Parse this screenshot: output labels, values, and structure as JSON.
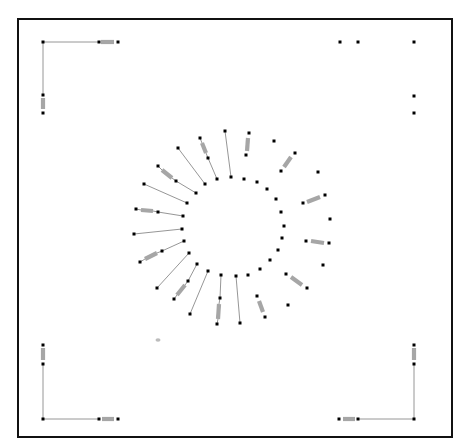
{
  "diagram": {
    "type": "circuit-layout",
    "frame": {
      "x": 18,
      "y": 19,
      "width": 434,
      "height": 418,
      "stroke": "#111111"
    },
    "colors": {
      "wire": "#8a8a8a",
      "node": "#000000",
      "resistor": "#a6a6a6",
      "background": "#ffffff"
    },
    "corners": [
      {
        "id": "top-left",
        "nodes": [
          [
            43,
            42
          ],
          [
            99,
            42
          ],
          [
            118,
            42
          ],
          [
            43,
            95
          ],
          [
            43,
            113
          ]
        ],
        "wires": [
          [
            43,
            42,
            99,
            42
          ],
          [
            43,
            42,
            43,
            95
          ]
        ],
        "resistors": [
          [
            101,
            42,
            114,
            42
          ],
          [
            43,
            98,
            43,
            109
          ]
        ]
      },
      {
        "id": "top-right",
        "nodes": [
          [
            340,
            42
          ],
          [
            358,
            42
          ],
          [
            414,
            42
          ],
          [
            414,
            96
          ],
          [
            414,
            113
          ]
        ],
        "wires": [],
        "resistors": []
      },
      {
        "id": "bottom-left",
        "nodes": [
          [
            43,
            345
          ],
          [
            43,
            364
          ],
          [
            43,
            419
          ],
          [
            99,
            419
          ],
          [
            118,
            419
          ]
        ],
        "wires": [
          [
            43,
            364,
            43,
            419
          ],
          [
            43,
            419,
            99,
            419
          ]
        ],
        "resistors": [
          [
            43,
            348,
            43,
            360
          ],
          [
            102,
            419,
            114,
            419
          ]
        ]
      },
      {
        "id": "bottom-right",
        "nodes": [
          [
            339,
            419
          ],
          [
            358,
            419
          ],
          [
            414,
            419
          ],
          [
            414,
            364
          ],
          [
            414,
            345
          ]
        ],
        "wires": [
          [
            358,
            419,
            414,
            419
          ],
          [
            414,
            419,
            414,
            364
          ]
        ],
        "resistors": [
          [
            343,
            419,
            355,
            419
          ],
          [
            414,
            348,
            414,
            360
          ]
        ]
      }
    ],
    "ring": {
      "inner_nodes": [
        [
          231,
          177
        ],
        [
          244,
          179
        ],
        [
          257,
          182
        ],
        [
          267,
          189
        ],
        [
          276,
          199
        ],
        [
          281,
          212
        ],
        [
          284,
          226
        ],
        [
          282,
          238
        ],
        [
          278,
          250
        ],
        [
          270,
          260
        ],
        [
          260,
          269
        ],
        [
          248,
          275
        ],
        [
          236,
          276
        ],
        [
          221,
          275
        ],
        [
          208,
          271
        ],
        [
          197,
          264
        ],
        [
          189,
          253
        ],
        [
          184,
          241
        ],
        [
          182,
          229
        ],
        [
          183,
          216
        ],
        [
          187,
          203
        ],
        [
          196,
          193
        ],
        [
          205,
          184
        ],
        [
          217,
          179
        ]
      ],
      "spokes": [
        {
          "outer": [
            225,
            131
          ],
          "inner": [
            231,
            177
          ],
          "wire": true
        },
        {
          "outer": [
            249,
            133
          ],
          "mid": [
            246,
            155
          ],
          "resistor": [
            248,
            138,
            247,
            151
          ],
          "wire": false
        },
        {
          "outer": [
            274,
            141
          ]
        },
        {
          "outer": [
            295,
            153
          ],
          "mid": [
            281,
            171
          ],
          "resistor": [
            291,
            157,
            284,
            167
          ],
          "wire": false
        },
        {
          "outer": [
            318,
            172
          ]
        },
        {
          "outer": [
            325,
            195
          ],
          "mid": [
            303,
            203
          ],
          "resistor": [
            320,
            197,
            307,
            202
          ],
          "wire": false
        },
        {
          "outer": [
            330,
            219
          ]
        },
        {
          "outer": [
            329,
            243
          ],
          "mid": [
            306,
            241
          ],
          "resistor": [
            324,
            243,
            311,
            241
          ],
          "wire": false
        },
        {
          "outer": [
            323,
            265
          ]
        },
        {
          "outer": [
            307,
            288
          ],
          "mid": [
            286,
            274
          ],
          "resistor": [
            302,
            285,
            291,
            277
          ],
          "wire": false
        },
        {
          "outer": [
            288,
            305
          ]
        },
        {
          "outer": [
            265,
            317
          ],
          "mid": [
            257,
            296
          ],
          "resistor": [
            263,
            312,
            259,
            301
          ],
          "wire": false
        },
        {
          "outer": [
            240,
            323
          ],
          "inner": [
            236,
            276
          ],
          "wire": true
        },
        {
          "outer": [
            217,
            324
          ],
          "mid": [
            220,
            298
          ],
          "inner": [
            221,
            275
          ],
          "resistor": [
            218,
            319,
            219,
            304
          ],
          "wire": true
        },
        {
          "outer": [
            190,
            314
          ],
          "inner": [
            208,
            271
          ],
          "wire": true
        },
        {
          "outer": [
            174,
            299
          ],
          "mid": [
            188,
            281
          ],
          "inner": [
            197,
            264
          ],
          "resistor": [
            177,
            295,
            185,
            285
          ],
          "wire": true
        },
        {
          "outer": [
            157,
            288
          ],
          "inner": [
            189,
            253
          ],
          "wire": true
        },
        {
          "outer": [
            140,
            262
          ],
          "mid": [
            162,
            251
          ],
          "inner": [
            184,
            241
          ],
          "resistor": [
            145,
            259,
            157,
            253
          ],
          "wire": true
        },
        {
          "outer": [
            134,
            234
          ],
          "inner": [
            182,
            229
          ],
          "wire": true
        },
        {
          "outer": [
            136,
            209
          ],
          "mid": [
            158,
            212
          ],
          "inner": [
            183,
            216
          ],
          "resistor": [
            141,
            210,
            153,
            211
          ],
          "wire": true
        },
        {
          "outer": [
            144,
            184
          ],
          "inner": [
            187,
            203
          ],
          "wire": true
        },
        {
          "outer": [
            158,
            166
          ],
          "mid": [
            176,
            181
          ],
          "inner": [
            196,
            193
          ],
          "resistor": [
            162,
            170,
            172,
            178
          ],
          "wire": true
        },
        {
          "outer": [
            178,
            148
          ],
          "inner": [
            205,
            184
          ],
          "wire": true
        },
        {
          "outer": [
            200,
            138
          ],
          "mid": [
            208,
            158
          ],
          "inner": [
            217,
            179
          ],
          "resistor": [
            202,
            143,
            206,
            153
          ],
          "wire": true
        }
      ]
    },
    "artifacts": [
      {
        "type": "smudge",
        "x": 158,
        "y": 340
      }
    ]
  }
}
